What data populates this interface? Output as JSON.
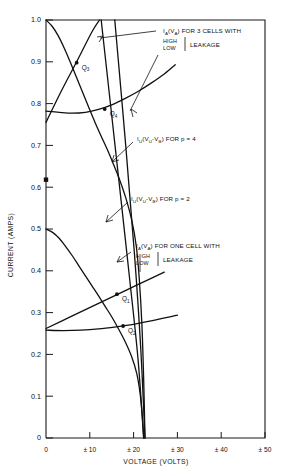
{
  "chart_data": {
    "type": "line",
    "title": "",
    "xlabel": "VOLTAGE (VOLTS)",
    "ylabel": "CURRENT (AMPS)",
    "xlim": [
      0,
      50
    ],
    "ylim": [
      0,
      1.0
    ],
    "grid": false,
    "legend_position": "none",
    "x_ticks": [
      "0",
      "± 10",
      "± 20",
      "± 30",
      "± 40",
      "± 50"
    ],
    "x_tick_values": [
      0,
      10,
      20,
      30,
      40,
      50
    ],
    "y_ticks": [
      "0",
      "0.1",
      "0.2",
      "0.3",
      "0.4",
      "0.5",
      "0.6",
      "0.7",
      "0.8",
      "0.9",
      "1.0"
    ],
    "y_tick_values": [
      0,
      0.1,
      0.2,
      0.3,
      0.4,
      0.5,
      0.6,
      0.7,
      0.8,
      0.9,
      1.0
    ],
    "series": [
      {
        "name": "IA(VA) 3 cells HIGH leakage",
        "comment": "descending curve from (0,1.00)",
        "points": [
          [
            0,
            1.0
          ],
          [
            1.4,
            0.985
          ],
          [
            2.8,
            0.962
          ],
          [
            4.2,
            0.932
          ],
          [
            5.6,
            0.898
          ],
          [
            7.0,
            0.862
          ],
          [
            8.4,
            0.826
          ],
          [
            9.8,
            0.79
          ],
          [
            11.2,
            0.755
          ],
          [
            12.6,
            0.722
          ],
          [
            14.0,
            0.69
          ],
          [
            15.4,
            0.655
          ],
          [
            16.8,
            0.618
          ],
          [
            18.2,
            0.575
          ],
          [
            19.6,
            0.52
          ],
          [
            20.6,
            0.46
          ],
          [
            21.3,
            0.38
          ],
          [
            21.9,
            0.27
          ],
          [
            22.3,
            0.14
          ],
          [
            22.6,
            0.0
          ]
        ]
      },
      {
        "name": "IA(VA) 3 cells LOW leakage",
        "comment": "ascending straight-ish line from (0,0.755) through Q3",
        "points": [
          [
            0,
            0.755
          ],
          [
            3.5,
            0.83
          ],
          [
            7.0,
            0.9
          ],
          [
            10.5,
            0.972
          ],
          [
            12.2,
            1.0
          ]
        ]
      },
      {
        "name": "IU(VU-VB) for p = 4",
        "comment": "rising concave curve starting (0,0.78) to right edge",
        "points": [
          [
            0,
            0.782
          ],
          [
            3,
            0.779
          ],
          [
            6,
            0.777
          ],
          [
            9,
            0.779
          ],
          [
            12,
            0.786
          ],
          [
            15,
            0.797
          ],
          [
            18,
            0.812
          ],
          [
            21,
            0.829
          ],
          [
            24,
            0.849
          ],
          [
            27,
            0.871
          ],
          [
            29.5,
            0.893
          ]
        ]
      },
      {
        "name": "IA(VA) one cell HIGH leakage",
        "comment": "descending curve from (0,0.50)",
        "points": [
          [
            0,
            0.5
          ],
          [
            1.5,
            0.492
          ],
          [
            3.0,
            0.478
          ],
          [
            4.5,
            0.458
          ],
          [
            6.0,
            0.436
          ],
          [
            7.5,
            0.412
          ],
          [
            9.0,
            0.388
          ],
          [
            10.5,
            0.364
          ],
          [
            12.0,
            0.34
          ],
          [
            13.5,
            0.315
          ],
          [
            15.0,
            0.29
          ],
          [
            16.5,
            0.262
          ],
          [
            18.0,
            0.232
          ],
          [
            19.5,
            0.196
          ],
          [
            20.7,
            0.155
          ],
          [
            21.5,
            0.105
          ],
          [
            22.0,
            0.05
          ],
          [
            22.3,
            0.0
          ]
        ]
      },
      {
        "name": "IA(VA) one cell LOW leakage",
        "comment": "ascending straight line from (0,0.262) through Q1",
        "points": [
          [
            0,
            0.262
          ],
          [
            6,
            0.292
          ],
          [
            12,
            0.322
          ],
          [
            18,
            0.352
          ],
          [
            24,
            0.382
          ],
          [
            27,
            0.397
          ]
        ]
      },
      {
        "name": "IU(VU-VB) for p = 2",
        "comment": "slowly rising curve from (0,0.258)",
        "points": [
          [
            0,
            0.258
          ],
          [
            4,
            0.257
          ],
          [
            8,
            0.258
          ],
          [
            12,
            0.261
          ],
          [
            16,
            0.266
          ],
          [
            20,
            0.272
          ],
          [
            24,
            0.28
          ],
          [
            28,
            0.289
          ],
          [
            30,
            0.294
          ]
        ]
      },
      {
        "name": "steep load line A",
        "comment": "near-vertical line crossing Q3 and Q1",
        "points": [
          [
            12.6,
            1.0
          ],
          [
            16.6,
            0.62
          ],
          [
            19.0,
            0.39
          ],
          [
            21.0,
            0.19
          ],
          [
            22.3,
            0.0
          ]
        ]
      },
      {
        "name": "steep load line B",
        "comment": "near-vertical line crossing Q4 and Q2",
        "points": [
          [
            15.7,
            1.0
          ],
          [
            18.2,
            0.7
          ],
          [
            20.2,
            0.44
          ],
          [
            21.6,
            0.22
          ],
          [
            22.6,
            0.0
          ]
        ]
      }
    ],
    "operating_points": [
      {
        "label": "Q",
        "sub": "3",
        "x": 7.0,
        "y": 0.898
      },
      {
        "label": "Q",
        "sub": "4",
        "x": 13.4,
        "y": 0.787
      },
      {
        "label": "Q",
        "sub": "1",
        "x": 16.2,
        "y": 0.344
      },
      {
        "label": "Q",
        "sub": "2",
        "x": 17.6,
        "y": 0.268
      }
    ],
    "axis_markers": [
      {
        "name": "y-axis-dot",
        "x": 0,
        "y": 0.618
      }
    ],
    "annotations": [
      {
        "id": "anno-3cells",
        "main": "I",
        "main_sub": "A",
        "main_rest": "(V",
        "main_sub2": "A",
        "main_tail": ") FOR 3 CELLS WITH",
        "line2_top": "HIGH",
        "line2_bot": "LOW",
        "line2_after": "LEAKAGE",
        "text_x": 163,
        "text_y": 33
      },
      {
        "id": "anno-p4",
        "main": "I",
        "main_sub": "U",
        "main_rest": "(V",
        "main_sub2": "U",
        "main_mid": "-V",
        "main_sub3": "B",
        "main_tail": ") FOR p = 4",
        "text_x": 137,
        "text_y": 139
      },
      {
        "id": "anno-p2",
        "main": "I",
        "main_sub": "U",
        "main_rest": "(V",
        "main_sub2": "U",
        "main_mid": "-V",
        "main_sub3": "B",
        "main_tail": ") FOR p = 2",
        "text_x": 131,
        "text_y": 199
      },
      {
        "id": "anno-onecell",
        "main": "I",
        "main_sub": "A",
        "main_rest": "(V",
        "main_sub2": "A",
        "main_tail": ") FOR ONE CELL WITH",
        "line2_top": "HIGH",
        "line2_bot": "LOW",
        "line2_after": "LEAKAGE",
        "text_x": 136,
        "text_y": 246
      }
    ],
    "colors": {
      "ink": "#111111",
      "background": "#ffffff"
    }
  }
}
